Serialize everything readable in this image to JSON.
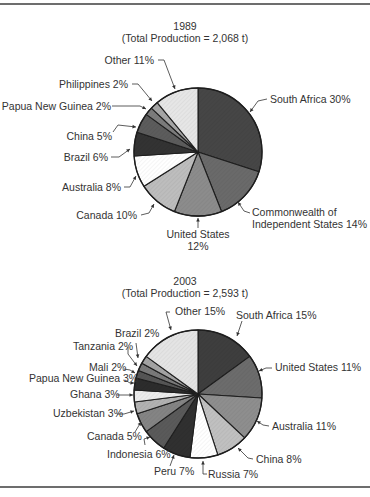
{
  "chart_data": [
    {
      "type": "pie",
      "title": "1989",
      "subtitle": "(Total Production = 2,068 t)",
      "total_production_t": 2068,
      "start_angle_deg": 0,
      "direction": "clockwise",
      "center": [
        198,
        152
      ],
      "radius": 64,
      "slices": [
        {
          "label": "South Africa",
          "value": 30,
          "fill": "#464646"
        },
        {
          "label": "Commonwealth of Independent States",
          "value": 14,
          "fill": "#6a6a6a"
        },
        {
          "label": "United States",
          "value": 12,
          "fill": "#8c8c8c"
        },
        {
          "label": "Canada",
          "value": 10,
          "fill": "#bdbdbd"
        },
        {
          "label": "Australia",
          "value": 8,
          "fill": "#ffffff"
        },
        {
          "label": "Brazil",
          "value": 6,
          "fill": "#333333"
        },
        {
          "label": "China",
          "value": 5,
          "fill": "#5c5c5c"
        },
        {
          "label": "Papua New Guinea",
          "value": 2,
          "fill": "#7c7c7c"
        },
        {
          "label": "Philippines",
          "value": 2,
          "fill": "#a6a6a6"
        },
        {
          "label": "Other",
          "value": 11,
          "fill": "#e6e6e6"
        }
      ],
      "labels": [
        {
          "lines": [
            "South Africa 30%"
          ],
          "x": 270,
          "y": 103,
          "anchor": "start",
          "leader": [
            [
              267,
              99
            ],
            [
              258,
              101
            ],
            [
              250,
              112
            ]
          ]
        },
        {
          "lines": [
            "Commonwealth of",
            "Independent States 14%"
          ],
          "x": 252,
          "y": 216,
          "anchor": "start",
          "leaders_note": "",
          "leader": [
            [
              250,
              213
            ],
            [
              244,
              211
            ],
            [
              238,
              202
            ]
          ]
        },
        {
          "lines": [
            "United States",
            "12%"
          ],
          "x": 198,
          "y": 238,
          "anchor": "middle",
          "leader": [
            [
              198,
              228
            ],
            [
              198,
              218
            ]
          ]
        },
        {
          "lines": [
            "Canada 10%"
          ],
          "x": 137,
          "y": 219,
          "anchor": "end",
          "leader": [
            [
              141,
              215
            ],
            [
              149,
              213
            ],
            [
              154,
              204
            ]
          ]
        },
        {
          "lines": [
            "Australia 8%"
          ],
          "x": 121,
          "y": 191,
          "anchor": "end",
          "leader": [
            [
              124,
              187
            ],
            [
              130,
              187
            ],
            [
              136,
              176
            ]
          ]
        },
        {
          "lines": [
            "Brazil 6%"
          ],
          "x": 108,
          "y": 161,
          "anchor": "end",
          "leader": [
            [
              111,
              157
            ],
            [
              119,
              157
            ],
            [
              130,
              149
            ]
          ]
        },
        {
          "lines": [
            "China 5%"
          ],
          "x": 112,
          "y": 140,
          "anchor": "end",
          "leader": [
            [
              113,
              132
            ],
            [
              118,
              125
            ],
            [
              136,
              127
            ]
          ]
        },
        {
          "lines": [
            "Papua New Guinea 2%"
          ],
          "x": 111,
          "y": 110,
          "anchor": "end",
          "leader": [
            [
              112,
              106
            ],
            [
              140,
              106
            ],
            [
              146,
              109
            ]
          ]
        },
        {
          "lines": [
            "Philippines 2%"
          ],
          "x": 128,
          "y": 88,
          "anchor": "end",
          "leader": [
            [
              132,
              84
            ],
            [
              138,
              84
            ],
            [
              152,
              101
            ]
          ]
        },
        {
          "lines": [
            "Other 11%"
          ],
          "x": 154,
          "y": 64,
          "anchor": "end",
          "leader": [
            [
              158,
              60
            ],
            [
              164,
              60
            ],
            [
              175,
              89
            ]
          ]
        }
      ]
    },
    {
      "type": "pie",
      "title": "2003",
      "subtitle": "(Total Production = 2,593 t)",
      "total_production_t": 2593,
      "start_angle_deg": 0,
      "direction": "clockwise",
      "center": [
        198,
        394
      ],
      "radius": 64,
      "slices": [
        {
          "label": "South Africa",
          "value": 15,
          "fill": "#3e3e3e"
        },
        {
          "label": "United States",
          "value": 11,
          "fill": "#6c6c6c"
        },
        {
          "label": "Australia",
          "value": 11,
          "fill": "#8e8e8e"
        },
        {
          "label": "China",
          "value": 8,
          "fill": "#c0c0c0"
        },
        {
          "label": "Russia",
          "value": 7,
          "fill": "#ffffff"
        },
        {
          "label": "Peru",
          "value": 7,
          "fill": "#303030"
        },
        {
          "label": "Indonesia",
          "value": 6,
          "fill": "#5a5a5a"
        },
        {
          "label": "Canada",
          "value": 5,
          "fill": "#848484"
        },
        {
          "label": "Uzbekistan",
          "value": 3,
          "fill": "#b2b2b2"
        },
        {
          "label": "Ghana",
          "value": 3,
          "fill": "#ececec"
        },
        {
          "label": "Papua New Guinea",
          "value": 3,
          "fill": "#2c2c2c"
        },
        {
          "label": "Mali",
          "value": 2,
          "fill": "#555555"
        },
        {
          "label": "Tanzania",
          "value": 2,
          "fill": "#7a7a7a"
        },
        {
          "label": "Brazil",
          "value": 2,
          "fill": "#a4a4a4"
        },
        {
          "label": "Other",
          "value": 15,
          "fill": "#e4e4e4"
        }
      ],
      "labels": [
        {
          "lines": [
            "South Africa 15%"
          ],
          "x": 236,
          "y": 319,
          "anchor": "start",
          "leader": [
            [
              242,
              321
            ],
            [
              237,
              336
            ]
          ]
        },
        {
          "lines": [
            "United States 11%"
          ],
          "x": 275,
          "y": 371,
          "anchor": "start",
          "leader": [
            [
              272,
              368
            ],
            [
              266,
              368
            ],
            [
              259,
              371
            ]
          ]
        },
        {
          "lines": [
            "Australia 11%"
          ],
          "x": 272,
          "y": 430,
          "anchor": "start",
          "leader": [
            [
              269,
              426
            ],
            [
              263,
              425
            ],
            [
              257,
              421
            ]
          ]
        },
        {
          "lines": [
            "China 8%"
          ],
          "x": 256,
          "y": 463,
          "anchor": "start",
          "leader": [
            [
              253,
              459
            ],
            [
              248,
              458
            ],
            [
              238,
              448
            ]
          ]
        },
        {
          "lines": [
            "Russia 7%"
          ],
          "x": 208,
          "y": 478,
          "anchor": "start",
          "leader": [
            [
              207,
              474
            ],
            [
              203,
              474
            ],
            [
              203,
              461
            ]
          ]
        },
        {
          "lines": [
            "Peru 7%"
          ],
          "x": 154,
          "y": 475,
          "anchor": "start",
          "leaders_note": "",
          "leader": [
            [
              170,
              466
            ],
            [
              174,
              455
            ]
          ]
        },
        {
          "lines": [
            "Indonesia 6%"
          ],
          "x": 107,
          "y": 458,
          "anchor": "start",
          "leader": [
            [
              145,
              445
            ],
            [
              144,
              439
            ],
            [
              150,
              437
            ]
          ]
        },
        {
          "lines": [
            "Canada 5%"
          ],
          "x": 87,
          "y": 440,
          "anchor": "start",
          "leader": [
            [
              135,
              432
            ],
            [
              141,
              422
            ]
          ]
        },
        {
          "lines": [
            "Uzbekistan 3%"
          ],
          "x": 53,
          "y": 417,
          "anchor": "start",
          "leader": [
            [
              117,
              414
            ],
            [
              124,
              414
            ],
            [
              134,
              411
            ]
          ]
        },
        {
          "lines": [
            "Ghana 3%"
          ],
          "x": 70,
          "y": 398,
          "anchor": "start",
          "leader": [
            [
              117,
              395
            ],
            [
              133,
              395
            ]
          ]
        },
        {
          "lines": [
            "Papua New Guinea 3%"
          ],
          "x": 29,
          "y": 382,
          "anchor": "start",
          "leader": [
            [
              125,
              380
            ],
            [
              130,
              383
            ],
            [
              134,
              383
            ]
          ]
        },
        {
          "lines": [
            "Mali 2%"
          ],
          "x": 89,
          "y": 371,
          "anchor": "start",
          "leader": [
            [
              124,
              369
            ],
            [
              130,
              370
            ],
            [
              135,
              373
            ]
          ]
        },
        {
          "lines": [
            "Tanzania 2%"
          ],
          "x": 73,
          "y": 350,
          "anchor": "start",
          "leader": [
            [
              128,
              347
            ],
            [
              128,
              354
            ],
            [
              137,
              366
            ]
          ]
        },
        {
          "lines": [
            "Brazil 2%"
          ],
          "x": 115,
          "y": 337,
          "anchor": "start",
          "leader": [
            [
              136,
              343
            ],
            [
              138,
              358
            ]
          ]
        },
        {
          "lines": [
            "Other 15%"
          ],
          "x": 175,
          "y": 315,
          "anchor": "start",
          "leader": [
            [
              170,
              312
            ],
            [
              166,
              312
            ],
            [
              171,
              330
            ]
          ]
        }
      ]
    }
  ],
  "titles": {
    "chart1_year": "1989",
    "chart1_total": "(Total Production = 2,068 t)",
    "chart2_year": "2003",
    "chart2_total": "(Total Production = 2,593 t)"
  }
}
